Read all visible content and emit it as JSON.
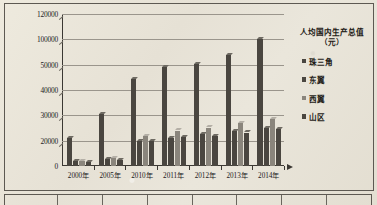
{
  "chart_data": {
    "type": "bar",
    "title": "",
    "legend_title": "人均国内生产总值（元）",
    "legend_title_line1": "人均国内生产总值",
    "legend_title_line2": "（元）",
    "legend_position": "right",
    "xlabel": "",
    "ylabel": "",
    "grid": true,
    "categories": [
      "2000年",
      "2005年",
      "2010年",
      "2011年",
      "2012年",
      "2013年",
      "2014年"
    ],
    "ytick_labels": [
      "0",
      "20000",
      "30000",
      "40000",
      "50000",
      "100000",
      "120000"
    ],
    "ytick_values": [
      0,
      20000,
      30000,
      40000,
      50000,
      100000,
      120000
    ],
    "ylim": [
      0,
      120000
    ],
    "axis_note": "非线性刻度",
    "series": [
      {
        "name": "珠三角",
        "color": "#4a4640",
        "values": [
          21000,
          30500,
          44500,
          49000,
          52000,
          69000,
          100500
        ]
      },
      {
        "name": "东翼",
        "color": "#4a4640",
        "values": [
          4200,
          5400,
          20000,
          21000,
          22500,
          23800,
          25000
        ]
      },
      {
        "name": "西翼",
        "color": "#8a857c",
        "values": [
          4000,
          6000,
          21700,
          24000,
          25200,
          27000,
          28500
        ]
      },
      {
        "name": "山区",
        "color": "#4a4640",
        "values": [
          3200,
          5000,
          20000,
          21500,
          22000,
          23200,
          24500
        ]
      }
    ]
  },
  "table_strip": {
    "cells": [
      "",
      "",
      "",
      "",
      "",
      "",
      "",
      ""
    ]
  }
}
